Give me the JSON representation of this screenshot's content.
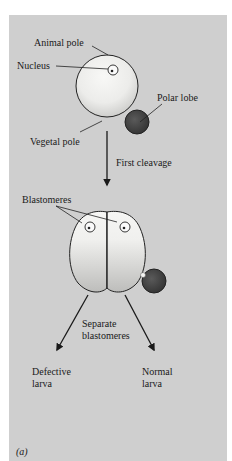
{
  "figure": {
    "labels": {
      "animal_pole": "Animal pole",
      "nucleus": "Nucleus",
      "polar_lobe": "Polar lobe",
      "vegetal_pole": "Vegetal pole",
      "first_cleavage": "First cleavage",
      "blastomeres": "Blastomeres",
      "separate_line1": "Separate",
      "separate_line2": "blastomeres",
      "defective_line1": "Defective",
      "defective_line2": "larva",
      "normal_line1": "Normal",
      "normal_line2": "larva"
    },
    "panel_label": "(a)",
    "colors": {
      "background": "#cfcfcf",
      "cell": "#f2f2f0",
      "polar_lobe": "#444444",
      "ink": "#1a1a1a"
    }
  }
}
